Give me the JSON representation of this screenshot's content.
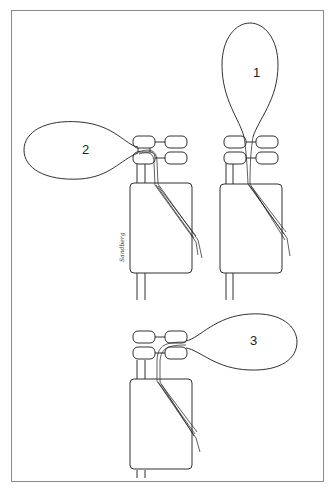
{
  "figure": {
    "type": "technical illustration",
    "border_color": "#8a8a8a",
    "line_color": "#1a1a1a",
    "background": "#ffffff"
  },
  "panels": [
    {
      "id": "fig2",
      "label": "2",
      "balloon_direction": "left"
    },
    {
      "id": "fig1",
      "label": "1",
      "balloon_direction": "up"
    },
    {
      "id": "fig3",
      "label": "3",
      "balloon_direction": "right"
    }
  ],
  "signature": {
    "text": "Sandberg"
  }
}
